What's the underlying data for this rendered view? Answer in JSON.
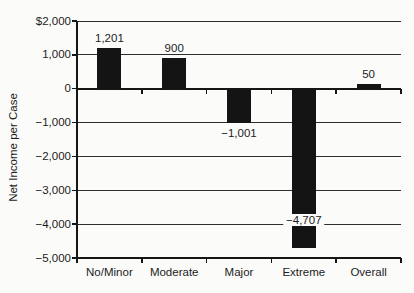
{
  "chart_data": {
    "type": "bar",
    "title": "",
    "xlabel": "",
    "ylabel": "Net Income per Case",
    "categories": [
      "No/Minor",
      "Moderate",
      "Major",
      "Extreme",
      "Overall"
    ],
    "values": [
      1201,
      900,
      -1001,
      -4707,
      50
    ],
    "value_labels": [
      "1,201",
      "900",
      "−1,001",
      "−4,707",
      "50"
    ],
    "label_positions": [
      "above",
      "above",
      "below",
      "inside",
      "above"
    ],
    "ylim": [
      -5000,
      2000
    ],
    "ytick_step": 1000,
    "ytick_labels": [
      "$2,000",
      "1,000",
      "0",
      "−1,000",
      "−2,000",
      "−3,000",
      "−4,000",
      "−5,000"
    ],
    "grid": true,
    "legend": "none",
    "colors": {
      "bar": "#141414",
      "grid": "#2e2e2e",
      "axis": "#161616",
      "text": "#1c1c1c",
      "background": "#fbfbfa"
    }
  }
}
